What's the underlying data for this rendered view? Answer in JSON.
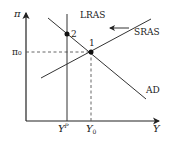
{
  "diagram": {
    "type": "AD-AS model",
    "axes": {
      "y_label": "π",
      "x_label": "Y"
    },
    "tick_labels": {
      "pi0": "π₀",
      "yp_base": "Y",
      "yp_sup": "P",
      "y0_base": "Y",
      "y0_sub": "0"
    },
    "curves": {
      "lras": "LRAS",
      "sras": "SRAS",
      "ad": "AD"
    },
    "points": {
      "p1": "1",
      "p2": "2"
    },
    "annotations": {
      "shift_arrow": "leftward shift of SRAS"
    },
    "colors": {
      "line": "#333333",
      "dashed": "#555555",
      "point": "#111111",
      "background": "#ffffff"
    }
  }
}
